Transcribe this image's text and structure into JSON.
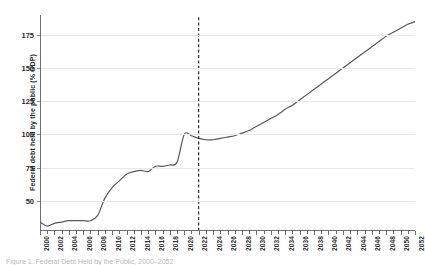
{
  "figure": {
    "caption": "Figure 1. Federal Debt Held by the Public, 2000–2052",
    "background_color": "#ffffff"
  },
  "chart_data": {
    "type": "line",
    "title": "",
    "subtitle": "",
    "xlabel": "",
    "ylabel": "Federal debt held by the public (% GDP)",
    "xlim": [
      2000,
      2052
    ],
    "ylim": [
      28,
      190
    ],
    "yticks": [
      50,
      75,
      100,
      125,
      150,
      175
    ],
    "ytick_labels": [
      "50",
      "75",
      "100",
      "125",
      "150",
      "175"
    ],
    "xticks": [
      2000,
      2002,
      2004,
      2006,
      2008,
      2010,
      2012,
      2014,
      2016,
      2018,
      2020,
      2022,
      2024,
      2026,
      2028,
      2030,
      2032,
      2034,
      2036,
      2038,
      2040,
      2042,
      2044,
      2046,
      2048,
      2050,
      2052
    ],
    "xtick_labels": [
      "2000",
      "2002",
      "2004",
      "2006",
      "2008",
      "2010",
      "2012",
      "2014",
      "2016",
      "2018",
      "2020",
      "2022",
      "2024",
      "2026",
      "2028",
      "2030",
      "2032",
      "2034",
      "2036",
      "2038",
      "2040",
      "2042",
      "2044",
      "2046",
      "2048",
      "2050",
      "2052"
    ],
    "xtick_rotation": 90,
    "grid": "horizontal",
    "grid_color": "#e8e8e8",
    "legend": "none",
    "line_color": "#595959",
    "line_width": 1.2,
    "annotations": [
      {
        "name": "projection-divider",
        "type": "vline",
        "x": 2022,
        "style": "dashed",
        "color": "#1a1a1a",
        "label": ""
      }
    ],
    "series": [
      {
        "name": "Federal debt held by the public",
        "x": [
          2000,
          2001,
          2002,
          2003,
          2004,
          2005,
          2006,
          2007,
          2008,
          2009,
          2010,
          2011,
          2012,
          2013,
          2014,
          2015,
          2016,
          2017,
          2018,
          2019,
          2020,
          2021,
          2022,
          2023,
          2024,
          2025,
          2026,
          2027,
          2028,
          2029,
          2030,
          2031,
          2032,
          2033,
          2034,
          2035,
          2036,
          2037,
          2038,
          2039,
          2040,
          2041,
          2042,
          2043,
          2044,
          2045,
          2046,
          2047,
          2048,
          2049,
          2050,
          2051,
          2052
        ],
        "values": [
          34,
          31,
          33,
          34,
          35,
          35,
          35,
          35,
          39,
          52,
          60,
          65,
          70,
          72,
          73,
          72,
          76,
          76,
          77,
          79,
          100,
          99,
          97,
          96,
          96,
          97,
          98,
          99,
          101,
          103,
          106,
          109,
          112,
          115,
          119,
          122,
          126,
          130,
          134,
          138,
          142,
          146,
          150,
          154,
          158,
          162,
          166,
          170,
          174,
          177,
          180,
          183,
          185
        ]
      }
    ]
  },
  "axes": {
    "y_title": "Federal debt held by the public (% GDP)",
    "y_tick_values": [
      "50",
      "75",
      "100",
      "125",
      "150",
      "175"
    ],
    "x_tick_values": [
      "2000",
      "2002",
      "2004",
      "2006",
      "2008",
      "2010",
      "2012",
      "2014",
      "2016",
      "2018",
      "2020",
      "2022",
      "2024",
      "2026",
      "2028",
      "2030",
      "2032",
      "2034",
      "2036",
      "2038",
      "2040",
      "2042",
      "2044",
      "2046",
      "2048",
      "2050",
      "2052"
    ]
  }
}
